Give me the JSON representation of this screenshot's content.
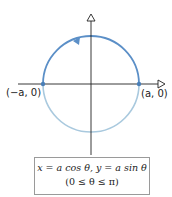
{
  "diagram": {
    "labels": {
      "left_point": "(−a, 0)",
      "right_point": "(a, 0)"
    },
    "equation": {
      "line1": "x = a cos θ,  y = a sin θ",
      "line2": "(0 ≤ θ ≤ π)"
    },
    "colors": {
      "upper_arc": "#5b8fc7",
      "lower_arc": "#a9c9de",
      "axes": "#222222",
      "points": "#4a7fb8"
    }
  }
}
